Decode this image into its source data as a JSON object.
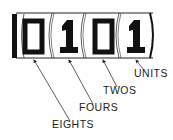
{
  "diagram": {
    "type": "binary-counter",
    "display_value": "0101",
    "digits": [
      {
        "value": "0",
        "place": "EIGHTS"
      },
      {
        "value": "1",
        "place": "FOURS"
      },
      {
        "value": "0",
        "place": "TWOS"
      },
      {
        "value": "1",
        "place": "UNITS"
      }
    ],
    "labels": {
      "units": "UNITS",
      "twos": "TWOS",
      "fours": "FOURS",
      "eights": "EIGHTS"
    },
    "colors": {
      "ink": "#111111",
      "background": "#ffffff"
    }
  }
}
